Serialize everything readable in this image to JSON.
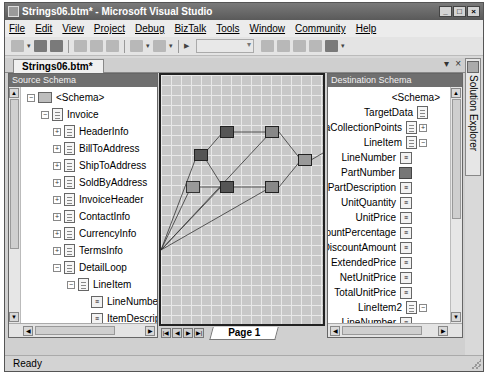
{
  "window": {
    "title": "Strings06.btm* - Microsoft Visual Studio",
    "controls": [
      "_",
      "□",
      "×"
    ]
  },
  "menu": [
    "File",
    "Edit",
    "View",
    "Project",
    "Debug",
    "BizTalk",
    "Tools",
    "Window",
    "Community",
    "Help"
  ],
  "toolbar": {
    "icons": [
      "new-project-icon",
      "save-icon",
      "save-all-icon",
      "cut-icon",
      "copy-icon",
      "paste-icon",
      "undo-icon",
      "redo-icon",
      "start-icon",
      "find-icon",
      "solution-explorer-icon",
      "properties-icon",
      "toolbox-icon",
      "object-browser-icon"
    ],
    "config_combo": ""
  },
  "document": {
    "tab": "Strings06.btm*",
    "controls": [
      "▾",
      "×"
    ]
  },
  "source_schema": {
    "header": "Source Schema",
    "nodes": [
      {
        "label": "<Schema>",
        "depth": 0,
        "icon": "folder",
        "expander": "−"
      },
      {
        "label": "Invoice",
        "depth": 1,
        "icon": "doc",
        "expander": "−"
      },
      {
        "label": "HeaderInfo",
        "depth": 2,
        "icon": "doc",
        "expander": "+"
      },
      {
        "label": "BillToAddress",
        "depth": 2,
        "icon": "doc",
        "expander": "+"
      },
      {
        "label": "ShipToAddress",
        "depth": 2,
        "icon": "doc",
        "expander": "+"
      },
      {
        "label": "SoldByAddress",
        "depth": 2,
        "icon": "doc",
        "expander": "+"
      },
      {
        "label": "InvoiceHeader",
        "depth": 2,
        "icon": "doc",
        "expander": "+"
      },
      {
        "label": "ContactInfo",
        "depth": 2,
        "icon": "doc",
        "expander": "+"
      },
      {
        "label": "CurrencyInfo",
        "depth": 2,
        "icon": "doc",
        "expander": "+"
      },
      {
        "label": "TermsInfo",
        "depth": 2,
        "icon": "doc",
        "expander": "+"
      },
      {
        "label": "DetailLoop",
        "depth": 2,
        "icon": "doc",
        "expander": "−"
      },
      {
        "label": "LineItem",
        "depth": 3,
        "icon": "doc",
        "expander": "−"
      },
      {
        "label": "LineNumber",
        "depth": 4,
        "icon": "field"
      },
      {
        "label": "ItemDescripti",
        "depth": 4,
        "icon": "field"
      },
      {
        "label": "Manufacture",
        "depth": 4,
        "icon": "field"
      },
      {
        "label": "BuyerPartNu",
        "depth": 4,
        "icon": "link"
      },
      {
        "label": "OrderedQuar",
        "depth": 4,
        "icon": "field"
      },
      {
        "label": "QuantityUOM",
        "depth": 4,
        "icon": "field"
      },
      {
        "label": "Price",
        "depth": 4,
        "icon": "field"
      },
      {
        "label": "PriceUOM",
        "depth": 4,
        "icon": "field"
      },
      {
        "label": "ParentPart",
        "depth": 4,
        "icon": "field"
      },
      {
        "label": "DiscountPerc",
        "depth": 4,
        "icon": "field"
      }
    ]
  },
  "destination_schema": {
    "header": "Destination Schema",
    "nodes": [
      {
        "label": "<Schema>",
        "icon": "none",
        "expander": ""
      },
      {
        "label": "TargetData",
        "icon": "doc",
        "expander": ""
      },
      {
        "label": "DataCollectionPoints",
        "icon": "doc",
        "expander": "+"
      },
      {
        "label": "LineItem",
        "icon": "doc",
        "expander": "−"
      },
      {
        "label": "LineNumber",
        "icon": "field"
      },
      {
        "label": "PartNumber",
        "icon": "link"
      },
      {
        "label": "PartDescription",
        "icon": "field"
      },
      {
        "label": "UnitQuantity",
        "icon": "field"
      },
      {
        "label": "UnitPrice",
        "icon": "field"
      },
      {
        "label": "UnitDiscountPercentage",
        "icon": "field"
      },
      {
        "label": "UnitDiscountAmount",
        "icon": "field"
      },
      {
        "label": "ExtendedPrice",
        "icon": "field"
      },
      {
        "label": "NetUnitPrice",
        "icon": "field"
      },
      {
        "label": "TotalUnitPrice",
        "icon": "field"
      },
      {
        "label": "LineItem2",
        "icon": "doc",
        "expander": "−"
      },
      {
        "label": "LineNumber",
        "icon": "field"
      },
      {
        "label": "PartNumber",
        "icon": "field"
      },
      {
        "label": "PartDescription",
        "icon": "field"
      },
      {
        "label": "UnitQuantity",
        "icon": "field"
      },
      {
        "label": "UnitPrice",
        "icon": "field"
      },
      {
        "label": "UnitDiscountPercentage",
        "icon": "field"
      },
      {
        "label": "UnitDiscountAmount",
        "icon": "field"
      }
    ]
  },
  "grid": {
    "page_tab": "Page 1",
    "pager_buttons": [
      "|◀",
      "◀",
      "▶",
      "▶|"
    ],
    "functoids": [
      "search-functoid",
      "string-functoid-a",
      "string-functoid-b",
      "string-functoid-c",
      "string-functoid-d",
      "string-functoid-e",
      "concatenate-functoid"
    ]
  },
  "side_panel": {
    "label": "Solution Explorer"
  },
  "status": {
    "text": "Ready"
  }
}
